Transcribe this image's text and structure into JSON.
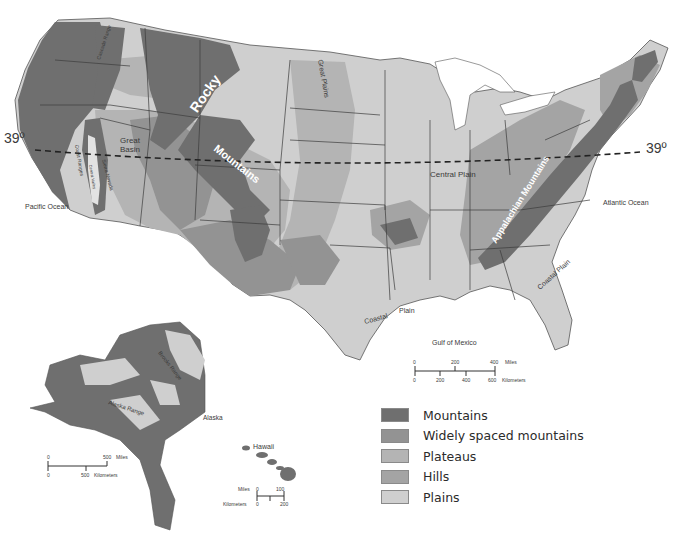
{
  "colors": {
    "mountains": "#6f6f6f",
    "widely_spaced_mountains": "#939393",
    "plateaus": "#b4b4b4",
    "hills": "#a4a4a4",
    "plains": "#cfcfcf",
    "water": "#ffffff",
    "border": "#3c3c3c"
  },
  "latitude": {
    "left_label": "39º",
    "right_label": "39º"
  },
  "oceans": {
    "pacific": "Pacific Ocean",
    "atlantic": "Atlantic Ocean",
    "gulf": "Gulf of Mexico"
  },
  "regions": {
    "rocky": "Rocky",
    "mountains": "Mountains",
    "great_basin_1": "Great",
    "great_basin_2": "Basin",
    "great_plains": "Great Plains",
    "central_plain": "Central Plain",
    "appalachian": "Appalachian Mountains",
    "coastal_plain_1": "Coastal",
    "coastal_plain_2": "Plain",
    "coastal_plain_east": "Coastal Plain",
    "cascade_range": "Cascade Range",
    "coast_ranges": "Coast Ranges",
    "sierra_nevada": "Sierra Nevada",
    "central_valley": "Central Valley",
    "brooks_range": "Brooks Range",
    "alaska_range": "Alaska Range",
    "alaska": "Alaska",
    "hawaii": "Hawaii"
  },
  "scales": {
    "conus": {
      "miles": [
        "0",
        "200",
        "400"
      ],
      "miles_unit": "Miles",
      "km": [
        "0",
        "200",
        "400",
        "600"
      ],
      "km_unit": "Kilometers"
    },
    "alaska": {
      "miles": [
        "0",
        "500"
      ],
      "miles_unit": "Miles",
      "km": [
        "0",
        "500"
      ],
      "km_unit": "Kilometers"
    },
    "hawaii": {
      "miles_unit": "Miles",
      "miles": [
        "0",
        "100"
      ],
      "km_unit": "Kilometers",
      "km": [
        "0",
        "200"
      ]
    }
  },
  "legend": {
    "items": [
      {
        "label": "Mountains",
        "color": "#6f6f6f"
      },
      {
        "label": "Widely spaced mountains",
        "color": "#939393"
      },
      {
        "label": "Plateaus",
        "color": "#b4b4b4"
      },
      {
        "label": "Hills",
        "color": "#a4a4a4"
      },
      {
        "label": "Plains",
        "color": "#cfcfcf"
      }
    ]
  }
}
